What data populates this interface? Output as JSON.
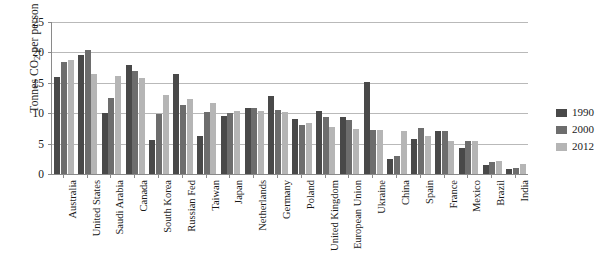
{
  "chart_data": {
    "type": "bar",
    "title": "",
    "subtitle": "",
    "xlabel": "",
    "ylabel": "Tonnes CO2 per person",
    "ylabel_rich": {
      "pre": "Tonnes CO",
      "sub": "2",
      "post": " per person"
    },
    "ylim": [
      0,
      25
    ],
    "yticks": [
      0,
      5,
      10,
      15,
      20,
      25
    ],
    "ytick_labels": [
      "0",
      "5",
      "10",
      "15",
      "20",
      "25"
    ],
    "grid": true,
    "grid_axis": "y",
    "legend_position": "right",
    "categories": [
      "Australia",
      "United States",
      "Saudi Arabia",
      "Canada",
      "South Korea",
      "Russian Fed",
      "Taiwan",
      "Japan",
      "Netherlands",
      "Germany",
      "Poland",
      "United Kingdom",
      "European Union",
      "Ukraine",
      "China",
      "Spain",
      "France",
      "Mexico",
      "Brazil",
      "India"
    ],
    "series": [
      {
        "name": "1990",
        "color": "#494949",
        "values": [
          16.0,
          19.5,
          10.0,
          18.0,
          5.6,
          16.5,
          6.3,
          9.5,
          10.9,
          12.8,
          9.0,
          10.3,
          9.3,
          15.1,
          2.4,
          5.8,
          7.0,
          4.2,
          1.5,
          0.8
        ]
      },
      {
        "name": "2000",
        "color": "#6d6d6d",
        "values": [
          18.4,
          20.4,
          12.5,
          17.0,
          9.8,
          11.4,
          10.2,
          10.0,
          10.9,
          10.6,
          8.0,
          9.3,
          8.9,
          7.2,
          2.9,
          7.5,
          7.0,
          5.5,
          1.9,
          1.0
        ]
      },
      {
        "name": "2012",
        "color": "#b5b5b5",
        "values": [
          18.8,
          16.4,
          16.2,
          15.8,
          13.0,
          12.3,
          11.6,
          10.3,
          10.4,
          10.2,
          8.4,
          7.8,
          7.4,
          7.3,
          7.1,
          6.3,
          5.5,
          5.4,
          2.2,
          1.7
        ]
      }
    ]
  }
}
